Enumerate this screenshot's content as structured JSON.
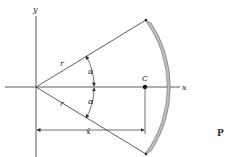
{
  "diagram": {
    "labels": {
      "y_axis": "y",
      "x_axis": "x",
      "radius_upper": "r",
      "radius_lower": "r",
      "angle_upper": "α",
      "angle_lower": "α",
      "centroid": "C",
      "centroid_distance": "x̄",
      "partial_caption": "P"
    },
    "colors": {
      "line": "#333333",
      "arc_fill": "#bdbdbd",
      "arc_stroke": "#555555",
      "background": "#ffffff"
    }
  }
}
